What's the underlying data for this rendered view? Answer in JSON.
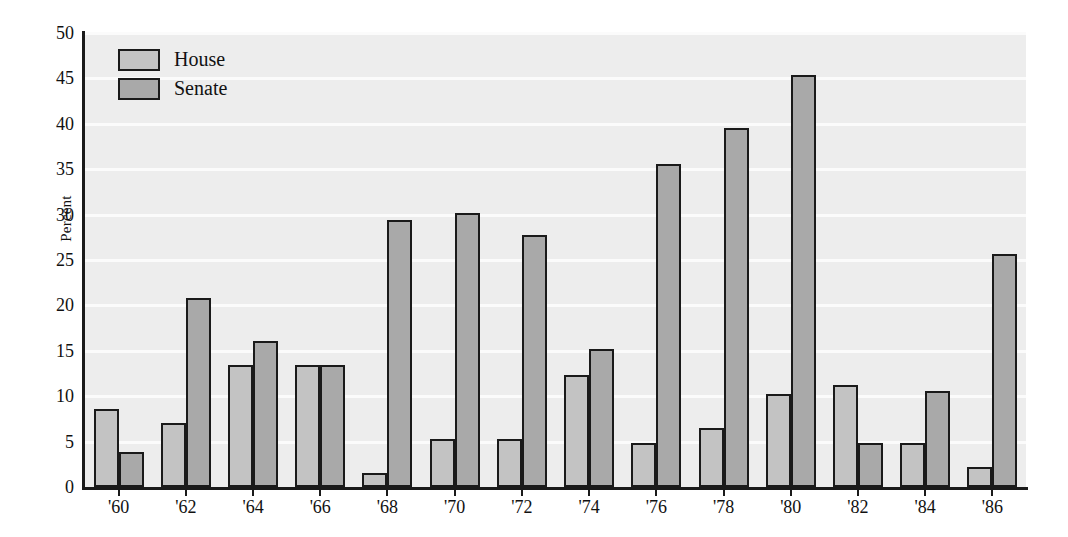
{
  "chart_data": {
    "type": "bar",
    "title": "",
    "xlabel": "",
    "ylabel": "Percent",
    "ylim": [
      0,
      50
    ],
    "yticks": [
      0,
      5,
      10,
      15,
      20,
      25,
      30,
      35,
      40,
      45,
      50
    ],
    "grid": true,
    "legend_position": "top-left",
    "categories": [
      "'60",
      "'62",
      "'64",
      "'66",
      "'68",
      "'70",
      "'72",
      "'74",
      "'76",
      "'78",
      "'80",
      "'82",
      "'84",
      "'86"
    ],
    "series": [
      {
        "name": "House",
        "color": "#c3c3c3",
        "values": [
          8.6,
          7.1,
          13.4,
          13.4,
          1.5,
          5.3,
          5.3,
          12.3,
          4.8,
          6.5,
          10.2,
          11.2,
          4.8,
          2.2
        ]
      },
      {
        "name": "Senate",
        "color": "#a9a9a9",
        "values": [
          3.9,
          20.8,
          16.1,
          13.4,
          29.4,
          30.2,
          27.8,
          15.2,
          35.6,
          39.5,
          45.4,
          4.9,
          10.6,
          25.7
        ]
      }
    ]
  },
  "colors": {
    "house": "#c3c3c3",
    "senate": "#a9a9a9",
    "plot_background": "#ededed",
    "gridline": "#fbfbfb",
    "axis": "#1a1a1a",
    "text": "#111111"
  }
}
